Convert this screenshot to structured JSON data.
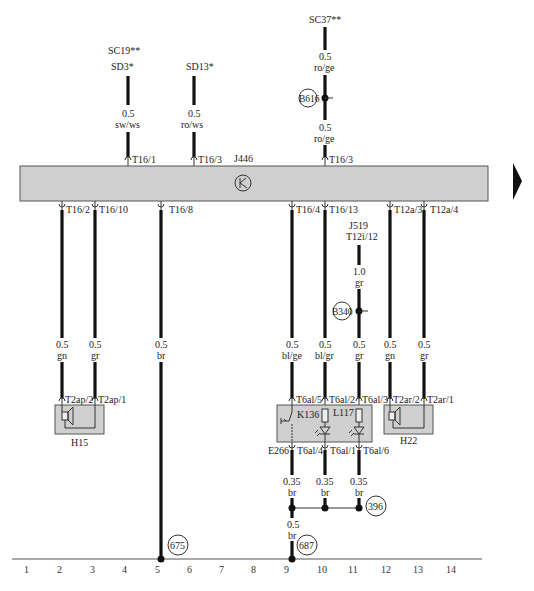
{
  "diagram": {
    "control_unit": {
      "id": "J446",
      "icon": "transistor-icon"
    },
    "top_connections": [
      {
        "source_lines": [
          "SC19**",
          "SD3*"
        ],
        "gauge": "0.5",
        "color": "sw/ws",
        "pin": "T16/1"
      },
      {
        "source_lines": [
          "SD13*"
        ],
        "gauge": "0.5",
        "color": "ro/ws",
        "pin": "T16/3"
      },
      {
        "source_lines": [
          "SC37**"
        ],
        "gauge_upper": "0.5",
        "color_upper": "ro/ge",
        "junction": "B616",
        "gauge": "0.5",
        "color": "ro/ge",
        "pin": "T16/3"
      }
    ],
    "bottom_pins": [
      "T16/2",
      "T16/10",
      "T16/8",
      "T16/4",
      "T16/13",
      "T12a/3",
      "T12a/4"
    ],
    "wires": [
      {
        "pin": "T16/2",
        "gauge": "0.5",
        "color": "gn"
      },
      {
        "pin": "T16/10",
        "gauge": "0.5",
        "color": "gr"
      },
      {
        "pin": "T16/8",
        "gauge": "0.5",
        "color": "br"
      },
      {
        "pin": "T16/4",
        "gauge": "0.5",
        "color": "bl/ge"
      },
      {
        "pin": "T16/13",
        "gauge": "0.5",
        "color": "bl/gr"
      },
      {
        "pin": "B340",
        "gauge": "0.5",
        "color": "gr"
      },
      {
        "pin": "T12a/3",
        "gauge": "0.5",
        "color": "gn"
      },
      {
        "pin": "T12a/4",
        "gauge": "0.5",
        "color": "gr"
      }
    ],
    "j519": {
      "id": "J519",
      "pin": "T12i/12",
      "gauge": "1.0",
      "color": "gr",
      "junction": "B340"
    },
    "components": {
      "h15": {
        "id": "H15",
        "pins": [
          "T2ap/2",
          "T2ap/1"
        ],
        "icon": "speaker-icon"
      },
      "h22": {
        "id": "H22",
        "pins": [
          "T2ar/2",
          "T2ar/1"
        ],
        "icon": "speaker-icon"
      },
      "module": {
        "top_pins": [
          "T6al/5",
          "T6al/2",
          "T6al/3"
        ],
        "bottom_pins": [
          "T6al/4",
          "T6al/1",
          "T6al/6"
        ],
        "switch": "K136",
        "lamp": "L117",
        "button_label": "E266"
      }
    },
    "ground_wires": [
      {
        "gauge": "0.35",
        "color": "br"
      },
      {
        "gauge": "0.35",
        "color": "br"
      },
      {
        "gauge": "0.35",
        "color": "br"
      }
    ],
    "ground_junction": "396",
    "ground_wire_main": {
      "gauge": "0.5",
      "color": "br"
    },
    "ground_points": [
      "675",
      "687"
    ],
    "grid_numbers": [
      "1",
      "2",
      "3",
      "4",
      "5",
      "6",
      "7",
      "8",
      "9",
      "10",
      "11",
      "12",
      "13",
      "14"
    ],
    "next_page_icon": "triangle-right-icon"
  },
  "colors": {
    "module_fill": "#cfcfcf",
    "wire": "#111111",
    "background": "#ffffff"
  }
}
